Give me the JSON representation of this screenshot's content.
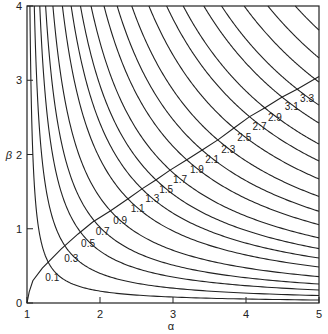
{
  "chart_data": {
    "type": "line",
    "title": "",
    "xlabel": "α",
    "ylabel": "β",
    "xlim": [
      1,
      5
    ],
    "ylim": [
      0,
      4
    ],
    "x_ticks": [
      "1",
      "2",
      "3",
      "4",
      "5"
    ],
    "y_ticks": [
      "0",
      "1",
      "2",
      "3",
      "4"
    ],
    "grid": false,
    "legend": "none",
    "contours": [
      {
        "label": "0.1",
        "k": 0.16,
        "at": [
          1.21,
          0.47
        ]
      },
      {
        "label": "0.3",
        "k": 0.4,
        "at": [
          1.47,
          0.73
        ]
      },
      {
        "label": "0.5",
        "k": 0.7,
        "at": [
          1.7,
          0.93
        ]
      },
      {
        "label": "0.7",
        "k": 1.02,
        "at": [
          1.9,
          1.09
        ]
      },
      {
        "label": "0.9",
        "k": 1.42,
        "at": [
          2.14,
          1.24
        ]
      },
      {
        "label": "1.1",
        "k": 1.94,
        "at": [
          2.38,
          1.4
        ]
      },
      {
        "label": "1.3",
        "k": 2.42,
        "at": [
          2.58,
          1.54
        ]
      },
      {
        "label": "1.5",
        "k": 2.93,
        "at": [
          2.77,
          1.66
        ]
      },
      {
        "label": "1.7",
        "k": 3.51,
        "at": [
          2.96,
          1.79
        ]
      },
      {
        "label": "1.9",
        "k": 4.22,
        "at": [
          3.19,
          1.93
        ]
      },
      {
        "label": "2.1",
        "k": 4.94,
        "at": [
          3.4,
          2.06
        ]
      },
      {
        "label": "2.3",
        "k": 5.74,
        "at": [
          3.62,
          2.2
        ]
      },
      {
        "label": "2.5",
        "k": 6.68,
        "at": [
          3.84,
          2.36
        ]
      },
      {
        "label": "2.7",
        "k": 7.65,
        "at": [
          4.05,
          2.51
        ]
      },
      {
        "label": "2.9",
        "k": 8.56,
        "at": [
          4.26,
          2.63
        ]
      },
      {
        "label": "3.1",
        "k": 9.69,
        "at": [
          4.49,
          2.77
        ]
      },
      {
        "label": "3.3",
        "k": 10.66,
        "at": [
          4.7,
          2.88
        ]
      },
      {
        "label": "",
        "k": 11.9,
        "at": null
      },
      {
        "label": "",
        "k": 13.2,
        "at": null
      },
      {
        "label": "",
        "k": 14.7,
        "at": null
      }
    ],
    "label_line": [
      [
        1.0,
        0.0
      ],
      [
        1.03,
        0.15
      ],
      [
        1.08,
        0.3
      ],
      [
        1.21,
        0.47
      ],
      [
        1.47,
        0.73
      ],
      [
        1.7,
        0.93
      ],
      [
        1.9,
        1.09
      ],
      [
        2.14,
        1.24
      ],
      [
        2.38,
        1.4
      ],
      [
        2.58,
        1.54
      ],
      [
        2.77,
        1.66
      ],
      [
        2.96,
        1.79
      ],
      [
        3.19,
        1.93
      ],
      [
        3.4,
        2.06
      ],
      [
        3.62,
        2.2
      ],
      [
        3.84,
        2.36
      ],
      [
        4.05,
        2.51
      ],
      [
        4.26,
        2.63
      ],
      [
        4.49,
        2.77
      ],
      [
        4.7,
        2.88
      ],
      [
        5.0,
        3.05
      ]
    ]
  },
  "layout": {
    "plot_left": 27,
    "plot_right": 319,
    "plot_top": 6,
    "plot_bottom": 303,
    "line_color": "#222222"
  }
}
